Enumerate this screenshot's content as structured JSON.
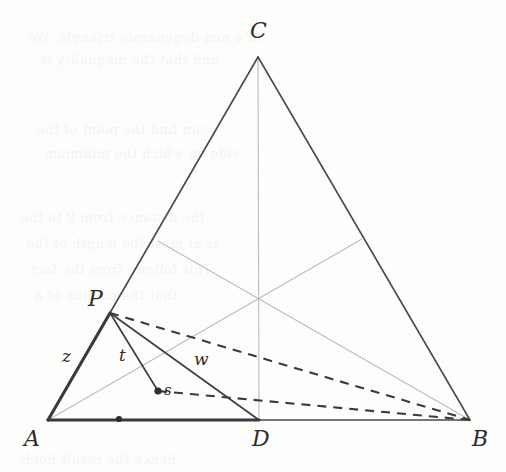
{
  "figure": {
    "background_color": "#fdfdfc",
    "ink_color": "#3a3a3a",
    "faint_ink_color": "#b9b9bd",
    "labels": {
      "A": "A",
      "B": "B",
      "C": "C",
      "D": "D",
      "P": "P",
      "s": "s",
      "z": "z",
      "t": "t",
      "w": "w"
    },
    "points": {
      "A": {
        "x": 48,
        "y": 420
      },
      "B": {
        "x": 470,
        "y": 420
      },
      "C": {
        "x": 258,
        "y": 57
      },
      "D": {
        "x": 259,
        "y": 420
      },
      "P": {
        "x": 110,
        "y": 313
      },
      "s": {
        "x": 158,
        "y": 391
      },
      "midAD": {
        "x": 119,
        "y": 419
      },
      "midAC": {
        "x": 158,
        "y": 241
      },
      "midBC": {
        "x": 362,
        "y": 239
      },
      "centroid": {
        "x": 258,
        "y": 297
      }
    },
    "label_positions": {
      "A": {
        "x": 24,
        "y": 428
      },
      "B": {
        "x": 472,
        "y": 428
      },
      "C": {
        "x": 250,
        "y": 20
      },
      "D": {
        "x": 252,
        "y": 428
      },
      "P": {
        "x": 88,
        "y": 288
      },
      "s": {
        "x": 164,
        "y": 383
      },
      "z": {
        "x": 62,
        "y": 348
      },
      "t": {
        "x": 119,
        "y": 347
      },
      "w": {
        "x": 194,
        "y": 351
      }
    },
    "segments": [
      {
        "name": "side-AC",
        "from": "A",
        "to": "C",
        "style": "solid-thin"
      },
      {
        "name": "side-BC",
        "from": "B",
        "to": "C",
        "style": "solid-thin"
      },
      {
        "name": "side-AB-right",
        "from": "D",
        "to": "B",
        "style": "solid-thin"
      },
      {
        "name": "side-AD-thick",
        "from": "A",
        "to": "D",
        "style": "solid-thick"
      },
      {
        "name": "segment-AP-z",
        "from": "A",
        "to": "P",
        "style": "solid-thick"
      },
      {
        "name": "segment-Ps-t",
        "from": "P",
        "to": "s",
        "style": "solid-thin"
      },
      {
        "name": "segment-PD-w",
        "from": "P",
        "to": "D",
        "style": "solid-thin"
      },
      {
        "name": "median-C-to-D",
        "from": "C",
        "to": "D",
        "style": "faint"
      },
      {
        "name": "median-A-to-midBC",
        "from": "A",
        "to": "midBC",
        "style": "faint"
      },
      {
        "name": "median-B-to-midAC",
        "from": "B",
        "to": "midAC",
        "style": "faint"
      },
      {
        "name": "dashed-P-to-B",
        "from": "P",
        "to": "B",
        "style": "dashed"
      },
      {
        "name": "dashed-s-to-B",
        "from": "s",
        "to": "B",
        "style": "dashed"
      }
    ],
    "markers": [
      {
        "name": "dot-on-AD",
        "x": 119,
        "y": 419
      },
      {
        "name": "dot-point-s",
        "x": 158,
        "y": 391
      }
    ]
  },
  "bleed_text": [
    {
      "text": "of a non-degenerate triangle. We",
      "x": 28,
      "y": 30
    },
    {
      "text": "and that the inequality is",
      "x": 40,
      "y": 52
    },
    {
      "text": "can find the point of the",
      "x": 36,
      "y": 122
    },
    {
      "text": "side on which the minimum",
      "x": 44,
      "y": 146
    },
    {
      "text": "the distance from P to the",
      "x": 20,
      "y": 210
    },
    {
      "text": "is at most the length of the",
      "x": 26,
      "y": 236
    },
    {
      "text": "This follows from the fact",
      "x": 30,
      "y": 262
    },
    {
      "text": "that the median of a",
      "x": 34,
      "y": 288
    },
    {
      "text": "hence the result holds",
      "x": 18,
      "y": 452
    }
  ]
}
